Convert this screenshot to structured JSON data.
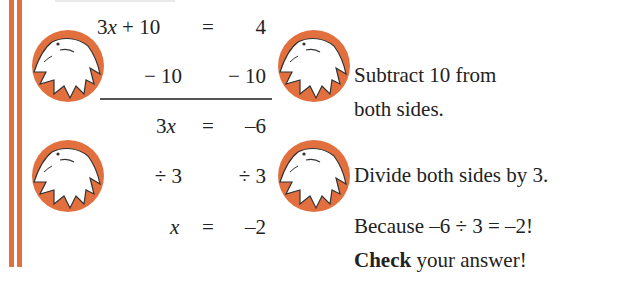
{
  "colors": {
    "accent_orange": "#e2703f",
    "text": "#222222",
    "rule": "#555555",
    "background": "#ffffff"
  },
  "equation": {
    "line1": {
      "lhs_coef": "3",
      "lhs_var": "x",
      "lhs_rest": " + 10",
      "eq": "=",
      "rhs": "4"
    },
    "line2": {
      "lhs": "− 10",
      "rhs": "− 10"
    },
    "line3": {
      "lhs_coef": "3",
      "lhs_var": "x",
      "eq": "=",
      "rhs": "–6"
    },
    "line4": {
      "lhs": "÷ 3",
      "rhs": "÷ 3"
    },
    "line5": {
      "lhs_var": "x",
      "eq": "=",
      "rhs": "–2"
    }
  },
  "notes": {
    "step1_line1": "Subtract 10 from",
    "step1_line2": "both sides.",
    "step2": "Divide both sides by 3.",
    "because": "Because –6 ÷ 3 = –2!",
    "check_bold": "Check",
    "check_rest": " your answer!"
  },
  "icons": {
    "hand": "hand-in-orange-circle-icon"
  }
}
